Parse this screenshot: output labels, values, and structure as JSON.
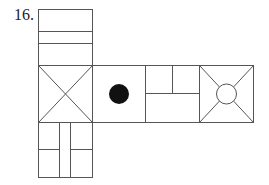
{
  "question": {
    "number_label": "16."
  },
  "diagram": {
    "type": "cube-net",
    "stroke_color": "#555555",
    "fill_color": "#111111",
    "faces": [
      {
        "id": "top",
        "pattern": "two-horizontal-lines"
      },
      {
        "id": "left",
        "pattern": "x-diagonals"
      },
      {
        "id": "center",
        "pattern": "black-dot"
      },
      {
        "id": "right",
        "pattern": "t-split"
      },
      {
        "id": "far-right",
        "pattern": "circle-with-diagonals"
      },
      {
        "id": "bottom",
        "pattern": "two-vertical-lines-with-bars"
      }
    ]
  }
}
